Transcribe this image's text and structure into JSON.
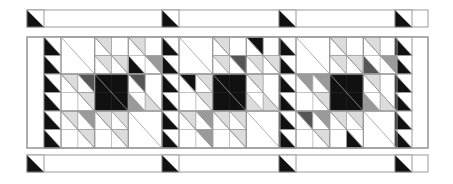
{
  "diagram": {
    "type": "quilt-border-pattern",
    "colors": {
      "black": "#111111",
      "dark": "#555555",
      "gray": "#9a9a9a",
      "light": "#dcdcdc",
      "white": "#ffffff",
      "line": "#9a9a9a"
    },
    "top_strip": {
      "x": 27,
      "y": 10,
      "w": 401,
      "h": 17,
      "triangle_x": [
        27,
        162,
        279,
        395
      ]
    },
    "bottom_strip": {
      "x": 27,
      "y": 155,
      "w": 401,
      "h": 17,
      "triangle_x": [
        27,
        162,
        279,
        395
      ]
    },
    "main": {
      "x": 27,
      "y": 37,
      "w": 401,
      "h": 111,
      "rows": 6,
      "sawtooth_columns_x": [
        44,
        162,
        279,
        395
      ],
      "sawtooth_width": 17,
      "block_x": [
        61,
        179,
        296
      ],
      "block_width": 101,
      "blocks": [
        {
          "name": "block-1",
          "cells": [
            [
              "",
              "",
              "U:l",
              "",
              "U:l",
              ""
            ],
            [
              "",
              "",
              "U:l",
              "U:l",
              "L:k",
              "U:g"
            ],
            [
              "U:l",
              "U:d",
              "F:k",
              "F:k",
              "U:d",
              ""
            ],
            [
              "",
              "U:l",
              "F:k",
              "F:k",
              "L:g",
              "L:l"
            ],
            [
              "U:l",
              "U:g",
              "U:l",
              "U:l",
              "",
              ""
            ],
            [
              "",
              "U:l",
              "",
              "U:l",
              "",
              ""
            ]
          ]
        },
        {
          "name": "block-2",
          "cells": [
            [
              "",
              "",
              "U:l",
              "",
              "U:k",
              ""
            ],
            [
              "",
              "",
              "U:l",
              "U:d",
              "U:l",
              "U:l"
            ],
            [
              "U:k",
              "U:l",
              "F:k",
              "F:k",
              "U:l",
              ""
            ],
            [
              "",
              "U:l",
              "F:k",
              "F:k",
              "L:l",
              "L:l"
            ],
            [
              "U:l",
              "U:g",
              "U:l",
              "U:l",
              "",
              ""
            ],
            [
              "",
              "U:g",
              "",
              "U:l",
              "",
              ""
            ]
          ]
        },
        {
          "name": "block-3",
          "cells": [
            [
              "",
              "",
              "U:l",
              "",
              "U:l",
              ""
            ],
            [
              "",
              "",
              "U:l",
              "U:l",
              "L:d",
              "U:g"
            ],
            [
              "U:g",
              "U:g",
              "F:k",
              "F:k",
              "U:l",
              ""
            ],
            [
              "",
              "U:l",
              "F:k",
              "F:k",
              "L:g",
              "L:l"
            ],
            [
              "U:d",
              "U:g",
              "U:l",
              "U:l",
              "",
              ""
            ],
            [
              "",
              "U:l",
              "",
              "L:k",
              "",
              ""
            ]
          ]
        }
      ]
    }
  }
}
